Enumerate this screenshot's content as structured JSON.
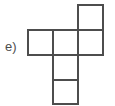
{
  "figure": {
    "label": "e)",
    "type": "cube-net",
    "colors": {
      "background": "#ffffff",
      "stroke": "#4d4d4d",
      "fill": "#ffffff",
      "label_text": "#4d4d4d"
    },
    "grid": {
      "cell_size": 25,
      "origin_x": 28,
      "origin_y": 5,
      "columns": 3,
      "rows": 4,
      "stroke_width": 1.6
    },
    "squares": [
      {
        "name": "square-top-right",
        "col": 2,
        "row": 0,
        "x": 78,
        "y": 5,
        "w": 25,
        "h": 25
      },
      {
        "name": "square-row-left",
        "col": 0,
        "row": 1,
        "x": 28,
        "y": 30,
        "w": 25,
        "h": 25
      },
      {
        "name": "square-row-center",
        "col": 1,
        "row": 1,
        "x": 53,
        "y": 30,
        "w": 25,
        "h": 25
      },
      {
        "name": "square-row-right",
        "col": 2,
        "row": 1,
        "x": 78,
        "y": 30,
        "w": 25,
        "h": 25
      },
      {
        "name": "square-column-upper",
        "col": 1,
        "row": 2,
        "x": 53,
        "y": 55,
        "w": 25,
        "h": 25
      },
      {
        "name": "square-column-lower",
        "col": 1,
        "row": 3,
        "x": 53,
        "y": 80,
        "w": 25,
        "h": 24
      }
    ],
    "square_count": 6
  }
}
